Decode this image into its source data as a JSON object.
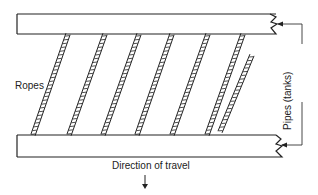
{
  "labels": {
    "ropes": "Ropes",
    "pipes": "Pipes (tanks)",
    "direction": "Direction of travel"
  },
  "diagram": {
    "top_pipe": {
      "x": 17,
      "y": 14,
      "w": 260,
      "h": 20
    },
    "bottom_pipe": {
      "x": 17,
      "y": 135,
      "w": 260,
      "h": 22
    },
    "ropes_top_x": [
      68,
      105,
      139,
      172,
      208,
      243
    ],
    "ropes_bottom_x": [
      33,
      69,
      103,
      137,
      172,
      207
    ],
    "short_rope": {
      "x1": 220,
      "y1": 132,
      "x2": 252,
      "y2": 55
    },
    "colors": {
      "line": "#222222",
      "background": "#ffffff"
    }
  }
}
